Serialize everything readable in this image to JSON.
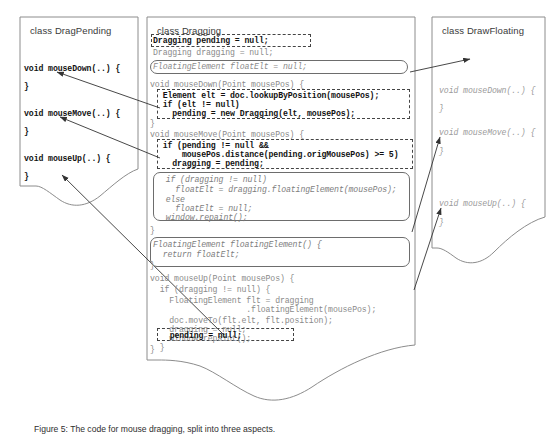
{
  "figure": {
    "kind": "uml-code-diagram",
    "caption": "Figure 5: The code for mouse dragging, split into three aspects."
  },
  "panels": {
    "left": {
      "title": "class DragPending",
      "lines": [
        {
          "text": "void mouseDown(..) {",
          "style": "bold"
        },
        {
          "text": "}",
          "style": "bold"
        },
        {
          "text": "void mouseMove(..) {",
          "style": "bold"
        },
        {
          "text": "}",
          "style": "bold"
        },
        {
          "text": "void mouseUp(..) {",
          "style": "bold"
        },
        {
          "text": "}",
          "style": "bold"
        }
      ]
    },
    "middle": {
      "title": "class Dragging",
      "lines": [
        {
          "text": "Dragging pending = null;",
          "style": "bold"
        },
        {
          "text": "Dragging dragging = null;",
          "style": "gray"
        },
        {
          "text": "FloatingElement floatElt = null;",
          "style": "gray-italic"
        },
        {
          "text": "void mouseDown(Point mousePos) {",
          "style": "gray"
        },
        {
          "text": "  Element elt = doc.lookupByPosition(mousePos);",
          "style": "bold"
        },
        {
          "text": "  if (elt != null)",
          "style": "bold"
        },
        {
          "text": "    pending = new Dragging(elt, mousePos);",
          "style": "bold"
        },
        {
          "text": "}",
          "style": "gray"
        },
        {
          "text": "void mouseMove(Point mousePos) {",
          "style": "gray"
        },
        {
          "text": "  if (pending != null &&",
          "style": "bold"
        },
        {
          "text": "      mousePos.distance(pending.origMousePos) >= 5)",
          "style": "bold"
        },
        {
          "text": "    dragging = pending;",
          "style": "bold"
        },
        {
          "text": "  if (dragging != null)",
          "style": "gray-italic"
        },
        {
          "text": "    floatElt = dragging.floatingElement(mousePos);",
          "style": "gray-italic"
        },
        {
          "text": "  else",
          "style": "gray-italic"
        },
        {
          "text": "    floatElt = null;",
          "style": "gray-italic"
        },
        {
          "text": "  window.repaint();",
          "style": "gray-italic"
        },
        {
          "text": "}",
          "style": "gray"
        },
        {
          "text": "FloatingElement floatingElement() {",
          "style": "gray-italic"
        },
        {
          "text": "  return floatElt;",
          "style": "gray-italic"
        },
        {
          "text": "}",
          "style": "gray"
        },
        {
          "text": "void mouseUp(Point mousePos) {",
          "style": "gray"
        },
        {
          "text": "  if (dragging != null) {",
          "style": "gray"
        },
        {
          "text": "    FloatingElement flt = dragging",
          "style": "gray"
        },
        {
          "text": "                    .floatingElement(mousePos);",
          "style": "gray"
        },
        {
          "text": "    doc.moveTo(flt.elt, flt.position);",
          "style": "gray"
        },
        {
          "text": "    dragging = null;",
          "style": "gray"
        },
        {
          "text": "    window.repaint();",
          "style": "gray"
        },
        {
          "text": "  }",
          "style": "gray"
        },
        {
          "text": "  pending = null;",
          "style": "bold"
        },
        {
          "text": "}",
          "style": "gray"
        }
      ]
    },
    "right": {
      "title": "class DrawFloating",
      "lines": [
        {
          "text": "void mouseDown(..) {",
          "style": "ghost"
        },
        {
          "text": "}",
          "style": "ghost"
        },
        {
          "text": "void mouseMove(..) {",
          "style": "ghost"
        },
        {
          "text": "}",
          "style": "ghost"
        },
        {
          "text": "void mouseUp(..) {",
          "style": "ghost"
        },
        {
          "text": "}",
          "style": "ghost"
        }
      ]
    }
  },
  "highlights": [
    {
      "name": "pending-field-box",
      "kind": "dashed"
    },
    {
      "name": "floatelt-field-box",
      "kind": "rounded"
    },
    {
      "name": "mousedown-body-box",
      "kind": "dashed"
    },
    {
      "name": "mousemove-pending-box",
      "kind": "dashed"
    },
    {
      "name": "mousemove-float-box",
      "kind": "rounded"
    },
    {
      "name": "floatingelement-method-box",
      "kind": "rounded"
    },
    {
      "name": "pending-null-box",
      "kind": "dashed"
    }
  ],
  "connectors": [
    {
      "name": "mousedown-to-dragpending",
      "from": "mousedown-body-box",
      "to": "left.mouseDown"
    },
    {
      "name": "mousemove-to-dragpending",
      "from": "mousemove-pending-box",
      "to": "left.mouseMove"
    },
    {
      "name": "pendingnull-to-dragpending",
      "from": "pending-null-box",
      "to": "left.mouseUp"
    },
    {
      "name": "floatelt-to-drawfloating",
      "from": "floatelt-field-box",
      "to": "right.top"
    },
    {
      "name": "floatbox-to-mousemove",
      "from": "mousemove-float-box",
      "to": "right.mouseMove"
    },
    {
      "name": "floatmethod-to-mouseup",
      "from": "floatingelement-method-box",
      "to": "right.mouseUp"
    }
  ],
  "colors": {
    "stroke": "#6d6d6d",
    "dash": "#444444",
    "bold_text": "#111111",
    "gray_text": "#8a8a8a",
    "title_text": "#3a3a3a",
    "background": "#ffffff"
  }
}
